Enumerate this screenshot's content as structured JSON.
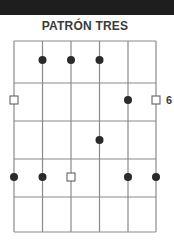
{
  "header": {
    "title": "PATRÓN TRES"
  },
  "side_label": "6",
  "diagram": {
    "type": "guitar-scale-pattern",
    "strings": 6,
    "frets": 5,
    "line_color": "#8a8a8a",
    "dot_color": "#2a2a2a",
    "root_color": "#ffffff",
    "notes": [
      {
        "string": 2,
        "fret": 1,
        "kind": "dot"
      },
      {
        "string": 3,
        "fret": 1,
        "kind": "dot"
      },
      {
        "string": 4,
        "fret": 1,
        "kind": "dot"
      },
      {
        "string": 1,
        "fret": 2,
        "kind": "root"
      },
      {
        "string": 5,
        "fret": 2,
        "kind": "dot"
      },
      {
        "string": 6,
        "fret": 2,
        "kind": "root"
      },
      {
        "string": 4,
        "fret": 3,
        "kind": "dot"
      },
      {
        "string": 1,
        "fret": 4,
        "kind": "dot"
      },
      {
        "string": 2,
        "fret": 4,
        "kind": "dot"
      },
      {
        "string": 3,
        "fret": 4,
        "kind": "root"
      },
      {
        "string": 5,
        "fret": 4,
        "kind": "dot"
      },
      {
        "string": 6,
        "fret": 4,
        "kind": "dot"
      }
    ]
  }
}
